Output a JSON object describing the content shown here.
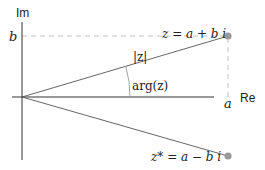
{
  "diagram": {
    "axes": {
      "real_label": "Re",
      "imag_label": "Im"
    },
    "tick_labels": {
      "a": "a",
      "b": "b"
    },
    "points": [
      {
        "name": "z",
        "label": "z = a + b i",
        "x": "a",
        "y": "b"
      },
      {
        "name": "z_conjugate",
        "label": "z* = a − b i",
        "x": "a",
        "y": "-b"
      }
    ],
    "labels": {
      "modulus": "|z|",
      "argument": "arg(z)",
      "z_expr": "z = a + b i",
      "zconj_expr": "z* = a − b i"
    },
    "colors": {
      "axis": "#333333",
      "line": "#666666",
      "dashed": "#bbbbbb",
      "point": "#999999",
      "text": "#222222"
    }
  }
}
